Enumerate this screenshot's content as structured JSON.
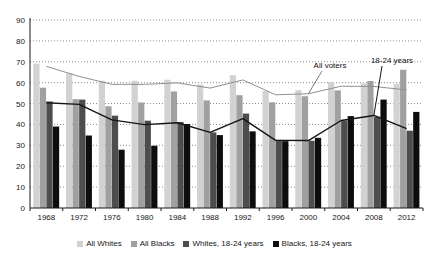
{
  "chart_data": {
    "type": "bar",
    "title": "",
    "subtitle": "",
    "xlabel": "",
    "ylabel": "",
    "xlim": [
      1966,
      2014
    ],
    "ylim": [
      0,
      90
    ],
    "ytick_step": 10,
    "yticks": [
      0,
      10,
      20,
      30,
      40,
      50,
      60,
      70,
      80,
      90
    ],
    "grid": true,
    "grid_style": "dotted-horizontal",
    "legend_position": "bottom",
    "categories": [
      1968,
      1972,
      1976,
      1980,
      1984,
      1988,
      1992,
      1996,
      2000,
      2004,
      2008,
      2012
    ],
    "tick_labels": [
      "1968",
      "1972",
      "1976",
      "1980",
      "1984",
      "1988",
      "1992",
      "1996",
      "2000",
      "2004",
      "2008",
      "2012"
    ],
    "series": [
      {
        "name": "All Whites",
        "kind": "bar",
        "color": "#d2d2d2",
        "values": [
          69.1,
          64.5,
          60.9,
          60.9,
          61.4,
          59.1,
          63.6,
          56.0,
          56.4,
          60.3,
          59.6,
          59.5
        ]
      },
      {
        "name": "All Blacks",
        "kind": "bar",
        "color": "#a0a0a0",
        "values": [
          57.6,
          52.1,
          48.7,
          50.5,
          55.8,
          51.5,
          54.0,
          50.6,
          53.5,
          56.3,
          60.8,
          66.2
        ]
      },
      {
        "name": "Whites, 18-24 years",
        "kind": "bar",
        "color": "#4d4d4d",
        "values": [
          51.0,
          51.9,
          44.2,
          41.8,
          41.2,
          36.2,
          45.2,
          32.6,
          32.2,
          41.8,
          43.7,
          37.0
        ]
      },
      {
        "name": "Blacks, 18-24 years",
        "kind": "bar",
        "color": "#0d0d0d",
        "values": [
          39.0,
          34.7,
          27.9,
          29.8,
          40.2,
          34.9,
          36.7,
          32.0,
          33.6,
          44.0,
          51.9,
          46.0
        ]
      },
      {
        "name": "All voters",
        "kind": "line",
        "color": "#8f8f8f",
        "values": [
          67.8,
          63.0,
          59.2,
          59.2,
          59.9,
          57.4,
          61.3,
          54.2,
          54.7,
          58.3,
          58.2,
          56.5
        ]
      },
      {
        "name": "18-24 years",
        "kind": "line",
        "color": "#141414",
        "values": [
          50.4,
          49.6,
          42.2,
          39.9,
          40.8,
          36.2,
          42.8,
          32.4,
          32.3,
          41.9,
          44.3,
          38.0
        ]
      }
    ],
    "annotations": [
      {
        "text": "All voters",
        "target_series": "All voters"
      },
      {
        "text": "18-24 years",
        "target_series": "18-24 years"
      }
    ]
  },
  "legend": {
    "items": [
      {
        "label": "All Whites",
        "color": "#d2d2d2"
      },
      {
        "label": "All Blacks",
        "color": "#a0a0a0"
      },
      {
        "label": "Whites, 18-24 years",
        "color": "#4d4d4d"
      },
      {
        "label": "Blacks, 18-24 years",
        "color": "#0d0d0d"
      }
    ]
  },
  "axis": {
    "y_tick_labels": [
      "90",
      "80",
      "70",
      "60",
      "50",
      "40",
      "30",
      "20",
      "10",
      "0"
    ]
  },
  "colors": {
    "grid": "#8a8a8a",
    "axis": "#1a1a1a",
    "background": "#ffffff",
    "all_voters_line": "#8f8f8f",
    "youth_line": "#141414"
  }
}
